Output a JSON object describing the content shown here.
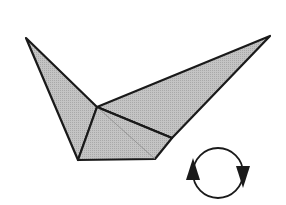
{
  "diagram": {
    "type": "origami-step",
    "figure": "folded-paper-model",
    "symbol": "turn-over-rotate",
    "colors": {
      "background": "#ffffff",
      "paper_fill": "#bdbdbd",
      "paper_fill_light": "#c8c8c8",
      "outline": "#1a1a1a",
      "arrow": "#1a1a1a"
    }
  }
}
